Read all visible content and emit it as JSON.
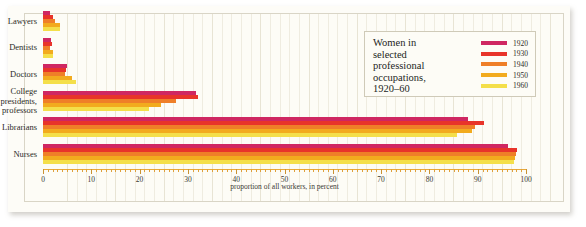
{
  "chart_data": {
    "type": "bar",
    "orientation": "horizontal",
    "xlabel": "proportion of all workers, in percent",
    "ylabel": "",
    "xlim": [
      0,
      100
    ],
    "xticks": [
      0,
      10,
      20,
      30,
      40,
      50,
      60,
      70,
      80,
      90,
      100
    ],
    "xticklabels": [
      "0",
      "10",
      "20",
      "30",
      "40",
      "50",
      "60",
      "70",
      "80",
      "90",
      "100"
    ],
    "minor_tick_step": 2,
    "grid": true,
    "grid_axis": "x",
    "legend_position": "upper right",
    "categories": [
      "Lawyers",
      "Dentists",
      "Doctors",
      "College presidents, professors",
      "Librarians",
      "Nurses"
    ],
    "series": [
      {
        "name": "1920",
        "color": "#cf2762",
        "values": [
          1.4,
          1.7,
          5.0,
          31.6,
          88.0,
          96.3
        ]
      },
      {
        "name": "1930",
        "color": "#e8342a",
        "values": [
          2.1,
          1.8,
          4.7,
          32.1,
          91.3,
          98.1
        ]
      },
      {
        "name": "1940",
        "color": "#ef7f28",
        "values": [
          2.4,
          1.5,
          4.6,
          27.6,
          89.5,
          97.9
        ]
      },
      {
        "name": "1950",
        "color": "#f2ab1e",
        "values": [
          3.5,
          2.1,
          6.1,
          24.5,
          88.8,
          97.8
        ]
      },
      {
        "name": "1960",
        "color": "#f4df4a",
        "values": [
          3.5,
          2.1,
          6.8,
          22.0,
          85.7,
          97.5
        ]
      }
    ]
  },
  "legend": {
    "title_lines": [
      "Women in",
      "selected",
      "professional",
      "occupations,",
      "1920–60"
    ],
    "entries": [
      {
        "year": "1920",
        "color": "#cf2762"
      },
      {
        "year": "1930",
        "color": "#e8342a"
      },
      {
        "year": "1940",
        "color": "#ef7f28"
      },
      {
        "year": "1950",
        "color": "#f2ab1e"
      },
      {
        "year": "1960",
        "color": "#f4df4a"
      }
    ]
  },
  "axis": {
    "title": "proportion of all workers, in percent"
  },
  "categories": [
    {
      "label_lines": [
        "Lawyers"
      ]
    },
    {
      "label_lines": [
        "Dentists"
      ]
    },
    {
      "label_lines": [
        "Doctors"
      ]
    },
    {
      "label_lines": [
        "College",
        "presidents,",
        "professors"
      ]
    },
    {
      "label_lines": [
        "Librarians"
      ]
    },
    {
      "label_lines": [
        "Nurses"
      ]
    }
  ]
}
